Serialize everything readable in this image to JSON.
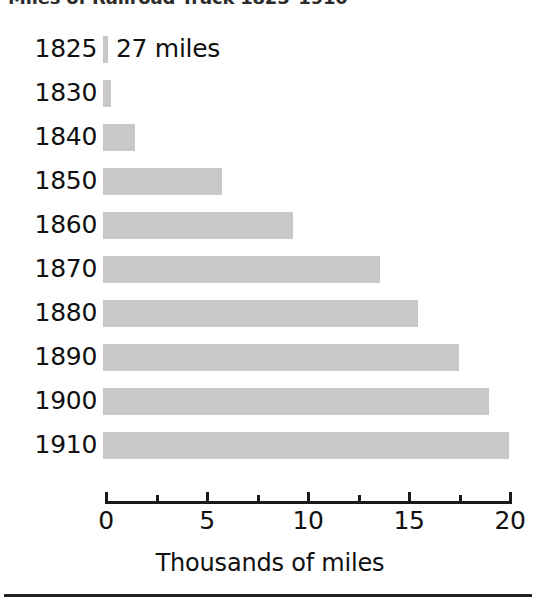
{
  "title": {
    "text": "Miles of Railroad Track 1825–1910",
    "clipped": true
  },
  "axis_title": "Thousands of miles",
  "annotation": {
    "label": "27 miles",
    "attached_to_year": "1825"
  },
  "axis": {
    "major_tick_labels": [
      "0",
      "5",
      "10",
      "15",
      "20"
    ],
    "major_tick_values": [
      0,
      5,
      10,
      15,
      20
    ],
    "minor_tick_values": [
      2.5,
      7.5,
      12.5,
      17.5
    ],
    "min": 0,
    "max": 20
  },
  "colors": {
    "bar": "#c8c8c8",
    "axis": "#1a1a1a",
    "text": "#111111",
    "rule": "#232323",
    "background": "#ffffff"
  },
  "chart_data": {
    "type": "bar",
    "orientation": "horizontal",
    "title": "Miles of Railroad Track 1825–1910",
    "xlabel": "Thousands of miles",
    "ylabel": "",
    "xlim": [
      0,
      20
    ],
    "grid": false,
    "legend": null,
    "categories": [
      "1825",
      "1830",
      "1840",
      "1850",
      "1860",
      "1870",
      "1880",
      "1890",
      "1900",
      "1910"
    ],
    "values": [
      0.027,
      0.4,
      1.6,
      5.9,
      9.4,
      13.7,
      15.6,
      17.6,
      19.1,
      20.1
    ],
    "value_unit": "thousands of miles",
    "annotations": [
      {
        "category": "1825",
        "text": "27 miles"
      }
    ],
    "bars": [
      {
        "year": "1825",
        "value": 0.027,
        "label": "27 miles"
      },
      {
        "year": "1830",
        "value": 0.4,
        "label": ""
      },
      {
        "year": "1840",
        "value": 1.6,
        "label": ""
      },
      {
        "year": "1850",
        "value": 5.9,
        "label": ""
      },
      {
        "year": "1860",
        "value": 9.4,
        "label": ""
      },
      {
        "year": "1870",
        "value": 13.7,
        "label": ""
      },
      {
        "year": "1880",
        "value": 15.6,
        "label": ""
      },
      {
        "year": "1890",
        "value": 17.6,
        "label": ""
      },
      {
        "year": "1900",
        "value": 19.1,
        "label": ""
      },
      {
        "year": "1910",
        "value": 20.1,
        "label": ""
      }
    ]
  }
}
